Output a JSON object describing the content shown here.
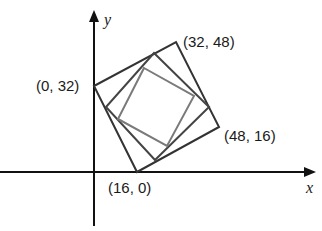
{
  "diagram": {
    "axes": {
      "x_label": "x",
      "y_label": "y"
    },
    "points": [
      {
        "label": "(0, 32)",
        "x": 0,
        "y": 32
      },
      {
        "label": "(32, 48)",
        "x": 32,
        "y": 48
      },
      {
        "label": "(48, 16)",
        "x": 48,
        "y": 16
      },
      {
        "label": "(16, 0)",
        "x": 16,
        "y": 0
      }
    ],
    "squares": [
      {
        "name": "outer",
        "vertices": [
          [
            0,
            32
          ],
          [
            32,
            48
          ],
          [
            48,
            16
          ],
          [
            16,
            0
          ]
        ],
        "color": "#333333"
      },
      {
        "name": "middle",
        "color": "#444444"
      },
      {
        "name": "inner",
        "color": "#777777"
      }
    ]
  }
}
